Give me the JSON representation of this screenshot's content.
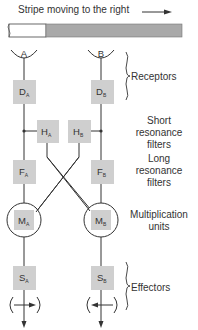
{
  "title": "Stripe moving to the right",
  "colors": {
    "box_fill": "#cfcfcf",
    "stripe_dark": "#a9a9a9",
    "line": "#333333",
    "text": "#333333"
  },
  "receptors": [
    {
      "id": "A",
      "label": "A"
    },
    {
      "id": "B",
      "label": "B"
    }
  ],
  "stages": [
    {
      "key": "receptors",
      "label_lines": [
        "Receptors"
      ],
      "boxes": [
        {
          "main": "D",
          "sub": "A"
        },
        {
          "main": "D",
          "sub": "B"
        }
      ]
    },
    {
      "key": "short",
      "label_lines": [
        "Short",
        "resonance",
        "filters"
      ],
      "boxes": [
        {
          "main": "H",
          "sub": "A"
        },
        {
          "main": "H",
          "sub": "B"
        }
      ]
    },
    {
      "key": "long",
      "label_lines": [
        "Long",
        "resonance",
        "filters"
      ],
      "boxes": [
        {
          "main": "F",
          "sub": "A"
        },
        {
          "main": "F",
          "sub": "B"
        }
      ]
    },
    {
      "key": "mult",
      "label_lines": [
        "Multiplication",
        "units"
      ],
      "boxes": [
        {
          "main": "M",
          "sub": "A"
        },
        {
          "main": "M",
          "sub": "B"
        }
      ]
    },
    {
      "key": "effectors",
      "label_lines": [
        "Effectors"
      ],
      "boxes": [
        {
          "main": "S",
          "sub": "A"
        },
        {
          "main": "S",
          "sub": "B"
        }
      ]
    }
  ],
  "labels": {
    "receptors": "Receptors",
    "short_1": "Short",
    "short_2": "resonance",
    "short_3": "filters",
    "long_1": "Long",
    "long_2": "resonance",
    "long_3": "filters",
    "mult_1": "Multiplication",
    "mult_2": "units",
    "effectors": "Effectors"
  },
  "nodes": {
    "DA": {
      "main": "D",
      "sub": "A"
    },
    "DB": {
      "main": "D",
      "sub": "B"
    },
    "HA": {
      "main": "H",
      "sub": "A"
    },
    "HB": {
      "main": "H",
      "sub": "B"
    },
    "FA": {
      "main": "F",
      "sub": "A"
    },
    "FB": {
      "main": "F",
      "sub": "B"
    },
    "MA": {
      "main": "M",
      "sub": "A"
    },
    "MB": {
      "main": "M",
      "sub": "B"
    },
    "SA": {
      "main": "S",
      "sub": "A"
    },
    "SB": {
      "main": "S",
      "sub": "B"
    }
  },
  "effector_directions": {
    "A": "right",
    "B": "left"
  },
  "stripe_direction": "right"
}
